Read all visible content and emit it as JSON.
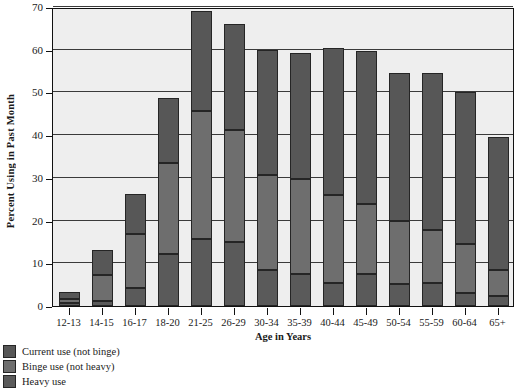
{
  "chart_data": {
    "type": "bar",
    "subtype": "stacked-vertical",
    "title": "",
    "xlabel": "Age in Years",
    "ylabel": "Percent  Using in Past Month",
    "ylim": [
      0,
      70
    ],
    "yticks": [
      0,
      10,
      20,
      30,
      40,
      50,
      60,
      70
    ],
    "ytick_labels": [
      "0",
      "10",
      "20",
      "30",
      "40",
      "50",
      "60",
      "70"
    ],
    "grid": true,
    "grid_axis": "y",
    "legend_position": "below-left",
    "categories": [
      "12-13",
      "14-15",
      "16-17",
      "18-20",
      "21-25",
      "26-29",
      "30-34",
      "35-39",
      "40-44",
      "45-49",
      "50-54",
      "55-59",
      "60-64",
      "65+"
    ],
    "series": [
      {
        "name": "Current use (not binge)",
        "color": "#575757",
        "values": [
          1.6,
          5.8,
          9.4,
          15.1,
          23.4,
          25.0,
          29.3,
          29.4,
          34.5,
          35.8,
          34.7,
          36.7,
          35.6,
          31.2
        ]
      },
      {
        "name": "Binge use (not heavy)",
        "color": "#6e6e6e",
        "values": [
          1.0,
          6.1,
          12.7,
          21.4,
          29.9,
          26.0,
          22.3,
          22.4,
          20.6,
          16.4,
          14.8,
          12.5,
          11.5,
          6.0
        ]
      },
      {
        "name": "Heavy use",
        "color": "#5a5a5a",
        "values": [
          0.6,
          1.1,
          4.2,
          12.1,
          15.7,
          15.1,
          8.4,
          7.4,
          5.3,
          7.4,
          5.1,
          5.3,
          3.0,
          2.4
        ]
      }
    ],
    "totals": [
      3.2,
      13.0,
      26.3,
      48.6,
      69.0,
      66.1,
      60.0,
      59.2,
      60.4,
      59.6,
      54.6,
      54.5,
      50.1,
      39.6
    ]
  },
  "legend": {
    "entries": [
      {
        "label": "Current use (not binge)",
        "swatch": "current"
      },
      {
        "label": "Binge use (not heavy)",
        "swatch": "binge"
      },
      {
        "label": "Heavy use",
        "swatch": "heavy"
      }
    ]
  }
}
